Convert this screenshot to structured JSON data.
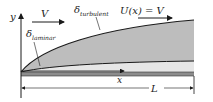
{
  "diagram": {
    "labels": {
      "y_axis": "y",
      "x_axis": "x",
      "free_stream": "V",
      "delta": "δ",
      "laminar_sub": "laminar",
      "turbulent_sub": "turbulent",
      "edge_velocity": "U(x) = V",
      "plate_length": "L"
    },
    "colors": {
      "turbulent_fill": "#bdbdbd",
      "laminar_fill": "#e6e6e6",
      "plate": "#8c8c8c",
      "line": "#1a1a1a"
    }
  }
}
